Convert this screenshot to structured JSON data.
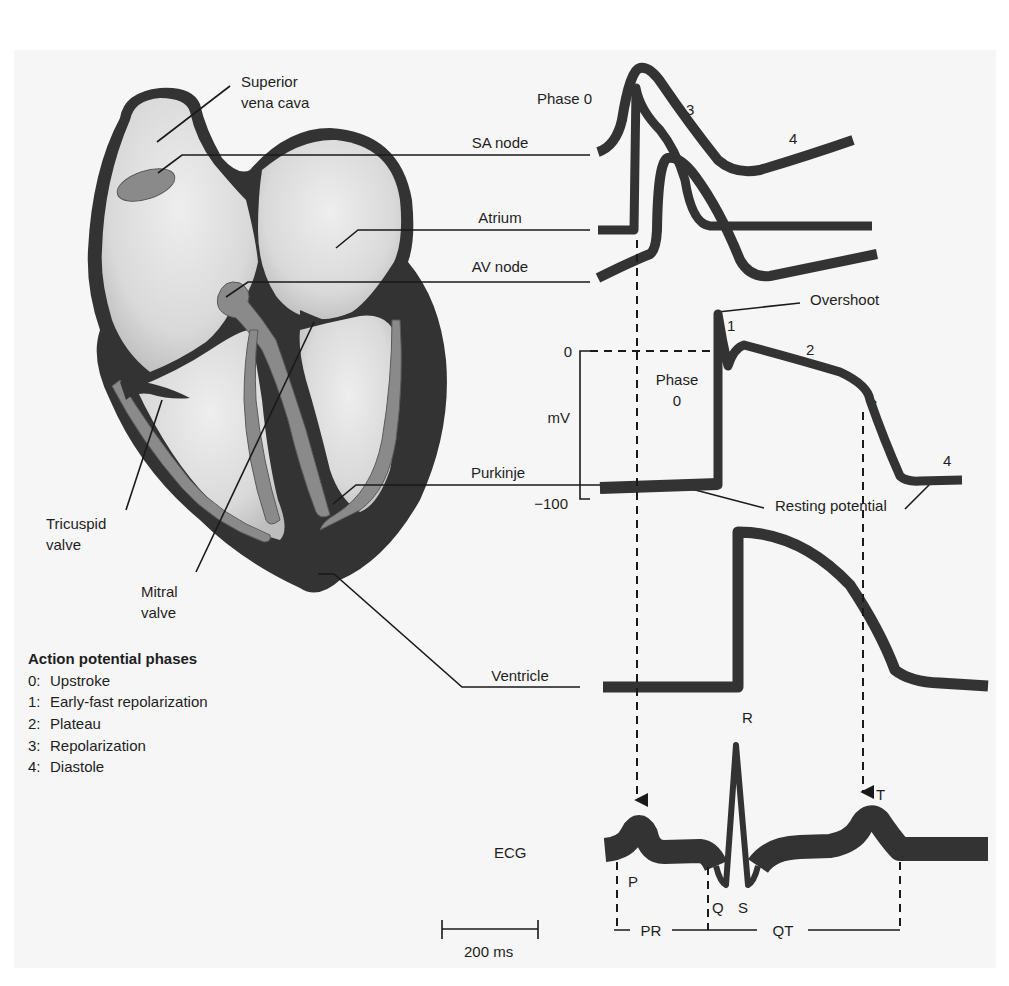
{
  "heart": {
    "labels": {
      "superior_vena_cava": [
        "Superior",
        "vena cava"
      ],
      "tricuspid_valve": [
        "Tricuspid",
        "valve"
      ],
      "mitral_valve": [
        "Mitral",
        "valve"
      ]
    }
  },
  "traces": {
    "sa_node": {
      "label": "SA node",
      "phase_labels": [
        "Phase 0",
        "3",
        "4"
      ]
    },
    "atrium": {
      "label": "Atrium"
    },
    "av_node": {
      "label": "AV node"
    },
    "purkinje": {
      "label": "Purkinje",
      "axis": {
        "unit": "mV",
        "top": "0",
        "bottom": "−100"
      },
      "annotations": {
        "overshoot": "Overshoot",
        "phase0": [
          "Phase",
          "0"
        ],
        "p1": "1",
        "p2": "2",
        "p3": "3",
        "p4": "4",
        "resting": "Resting potential"
      }
    },
    "ventricle": {
      "label": "Ventricle"
    },
    "ecg": {
      "label": "ECG",
      "waves": {
        "P": "P",
        "Q": "Q",
        "R": "R",
        "S": "S",
        "T": "T"
      },
      "intervals": {
        "PR": "PR",
        "QT": "QT"
      }
    }
  },
  "scale_bar": {
    "label": "200 ms"
  },
  "legend": {
    "title": "Action potential phases",
    "items": [
      {
        "key": "0:",
        "text": "Upstroke"
      },
      {
        "key": "1:",
        "text": "Early-fast repolarization"
      },
      {
        "key": "2:",
        "text": "Plateau"
      },
      {
        "key": "3:",
        "text": "Repolarization"
      },
      {
        "key": "4:",
        "text": "Diastole"
      }
    ]
  },
  "colors": {
    "panel": "#f6f6f6",
    "tissue": "#333333",
    "conduction": "#8a8a8a",
    "chamber_light": "#e8e8e8"
  }
}
